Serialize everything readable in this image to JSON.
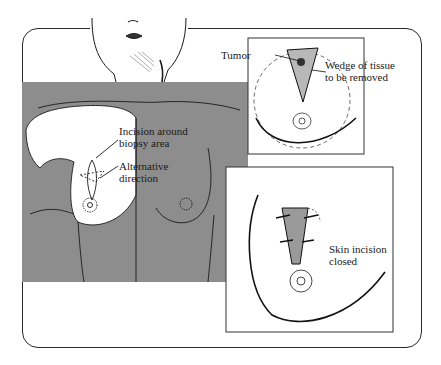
{
  "figure": {
    "colors": {
      "background": "#ffffff",
      "panel_gray": "#8d8d8d",
      "line": "#1a1a1a",
      "tissue_shade": "#9a9a9a"
    },
    "main_panel": {
      "labels": {
        "incision_line1": "Incision around",
        "incision_line2": "biopsy area",
        "alternative_line1": "Alternative",
        "alternative_line2": "direction"
      }
    },
    "inset_top": {
      "labels": {
        "tumor": "Tumor",
        "wedge_line1": "Wedge of tissue",
        "wedge_line2": "to be removed"
      }
    },
    "inset_bottom": {
      "labels": {
        "closed_line1": "Skin incision",
        "closed_line2": "closed"
      }
    }
  }
}
